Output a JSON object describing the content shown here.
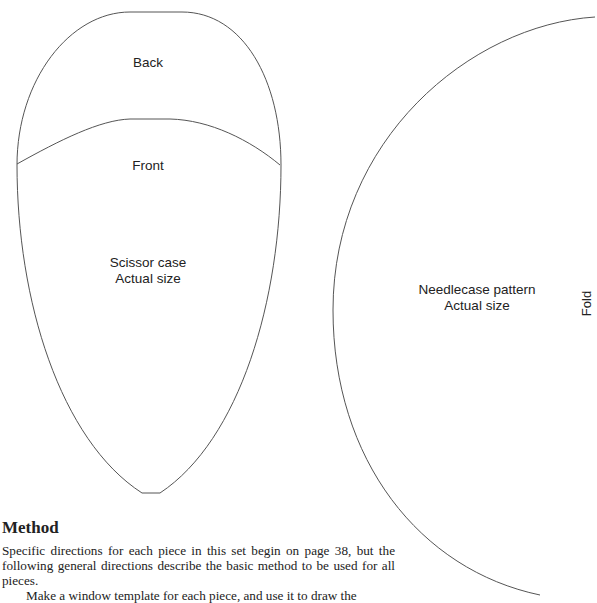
{
  "scissor_case": {
    "top_label": "Back",
    "middle_label": "Front",
    "title_line1": "Scissor case",
    "title_line2": "Actual size"
  },
  "needlecase": {
    "title_line1": "Needlecase pattern",
    "title_line2": "Actual size",
    "fold_label": "Fold"
  },
  "method": {
    "heading": "Method",
    "paragraphs": [
      "Specific directions for each piece in this set begin on page 38, but the following general directions describe the basic method to be used for all pieces.",
      "Make a window template for each piece, and use it to draw the"
    ]
  },
  "colors": {
    "outline": "#555555",
    "text": "#222222",
    "background": "#ffffff"
  }
}
